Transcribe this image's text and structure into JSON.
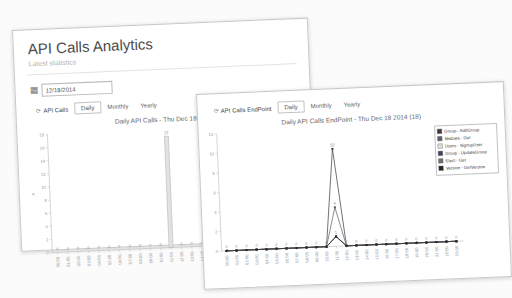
{
  "back_window": {
    "title": "API Calls Analytics",
    "subtitle": "Latest statistics",
    "date_value": "12/18/2014",
    "tab_main": "API Calls",
    "tabs": [
      "Daily",
      "Monthly",
      "Yearly"
    ],
    "active_tab": "Daily"
  },
  "front_window": {
    "tab_main": "API Calls EndPoint",
    "tabs": [
      "Daily",
      "Monthly",
      "Yearly"
    ],
    "active_tab": "Daily"
  },
  "icons": {
    "refresh": "⟳",
    "calendar": "▦"
  },
  "colors": {
    "axis": "#bbbbbb",
    "tick_text": "#999999",
    "data_label": "#888888",
    "bar_fill": "#e2e2e2",
    "bar_border": "#aeaeae",
    "legend_border": "#999999"
  },
  "chart_data": [
    {
      "type": "bar",
      "title": "Daily API Calls - Thu Dec 18 2014",
      "categories": [
        "00:00",
        "01:00",
        "02:00",
        "03:00",
        "04:00",
        "05:00",
        "06:00",
        "07:00",
        "08:00",
        "09:00",
        "10:00",
        "11:00",
        "12:00",
        "13:00",
        "14:00",
        "15:00",
        "16:00",
        "17:00",
        "18:00",
        "19:00",
        "20:00",
        "21:00",
        "22:00",
        "23:00"
      ],
      "values": [
        0,
        0,
        0,
        0,
        0,
        0,
        0,
        0,
        0,
        0,
        0,
        17,
        0,
        0,
        0,
        0,
        0,
        0,
        0,
        0,
        0,
        0,
        0,
        0
      ],
      "ylabel": "#",
      "ylim": [
        0,
        18
      ],
      "ytick_step": 2,
      "grid": false,
      "legend": false
    },
    {
      "type": "line",
      "title": "Daily API Calls EndPoint - Thu Dec 18 2014 (18)",
      "categories": [
        "00:00",
        "01:00",
        "02:00",
        "03:00",
        "04:00",
        "05:00",
        "06:00",
        "07:00",
        "08:00",
        "09:00",
        "10:00",
        "11:00",
        "12:00",
        "13:00",
        "14:00",
        "15:00",
        "16:00",
        "17:00",
        "18:00",
        "19:00",
        "20:00",
        "21:00",
        "22:00",
        "23:00"
      ],
      "series": [
        {
          "name": "Group - AddGroup",
          "color": "#3a3a3a",
          "values": [
            0,
            0,
            0,
            0,
            0,
            0,
            0,
            0,
            0,
            0,
            0,
            10,
            0,
            0,
            0,
            0,
            0,
            0,
            0,
            0,
            0,
            0,
            0,
            0
          ]
        },
        {
          "name": "MeData - Get",
          "color": "#5a6070",
          "values": [
            0,
            0,
            0,
            0,
            0,
            0,
            0,
            0,
            0,
            0,
            0,
            4,
            0,
            0,
            0,
            0,
            0,
            0,
            0,
            0,
            0,
            0,
            0,
            0
          ]
        },
        {
          "name": "Users - SignupUser",
          "color": "#dedede",
          "values": [
            0,
            0,
            0,
            0,
            0,
            0,
            0,
            0,
            0,
            0,
            0,
            1,
            0,
            0,
            0,
            0,
            0,
            0,
            0,
            0,
            0,
            0,
            0,
            0
          ]
        },
        {
          "name": "Group - UpdateGroup",
          "color": "#41415a",
          "values": [
            0,
            0,
            0,
            0,
            0,
            0,
            0,
            0,
            0,
            0,
            0,
            1,
            0,
            0,
            0,
            0,
            0,
            0,
            0,
            0,
            0,
            0,
            0,
            0
          ]
        },
        {
          "name": "Elect - Get",
          "color": "#6e6e6e",
          "values": [
            0,
            0,
            0,
            0,
            0,
            0,
            0,
            0,
            0,
            0,
            0,
            1,
            0,
            0,
            0,
            0,
            0,
            0,
            0,
            0,
            0,
            0,
            0,
            0
          ]
        },
        {
          "name": "Version - GetVersion",
          "color": "#262626",
          "values": [
            0,
            0,
            0,
            0,
            0,
            0,
            0,
            0,
            0,
            0,
            0,
            1,
            0,
            0,
            0,
            0,
            0,
            0,
            0,
            0,
            0,
            0,
            0,
            0
          ]
        }
      ],
      "ylim": [
        0,
        12
      ],
      "ytick_step": 2,
      "grid": false,
      "legend": true,
      "legend_position": "right"
    }
  ]
}
